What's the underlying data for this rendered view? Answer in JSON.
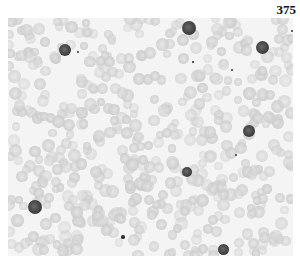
{
  "page": {
    "number": "375"
  },
  "micrograph": {
    "description": "Grayscale photomicrograph of a blood smear showing erythrocytes and scattered dark-nucleated cells",
    "background_color": "#f4f4f4",
    "nucleated_cells": [
      {
        "x": 65,
        "y": 50,
        "r": 6
      },
      {
        "x": 189,
        "y": 28,
        "r": 7
      },
      {
        "x": 262,
        "y": 47,
        "r": 6.5
      },
      {
        "x": 249,
        "y": 131,
        "r": 6
      },
      {
        "x": 187,
        "y": 172,
        "r": 5
      },
      {
        "x": 35,
        "y": 207,
        "r": 7
      },
      {
        "x": 223,
        "y": 249,
        "r": 5.5
      }
    ],
    "specks": [
      {
        "x": 78,
        "y": 52,
        "r": 1
      },
      {
        "x": 123,
        "y": 237,
        "r": 1.6
      },
      {
        "x": 232,
        "y": 70,
        "r": 1.2
      },
      {
        "x": 236,
        "y": 155,
        "r": 1
      },
      {
        "x": 292,
        "y": 31,
        "r": 1
      },
      {
        "x": 193,
        "y": 62,
        "r": 0.8
      }
    ]
  }
}
